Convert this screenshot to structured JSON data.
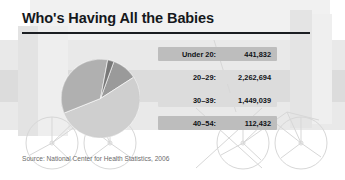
{
  "figure": {
    "title": "Who's Having All the Babies",
    "source": "Source: National Center for Health Statistics, 2006"
  },
  "colors": {
    "title_text": "#15181c",
    "title_rule": "#1b1e22",
    "row_dark": "#bdbdbd",
    "row_light": "#dcdcdc",
    "row_text": "#101317",
    "source_text": "#6b6b6b",
    "slice_under20": "#9a9a9a",
    "slice_20_29": "#cfcfcf",
    "slice_30_39": "#b0b0b0",
    "slice_40_54": "#787878",
    "background": "#ffffff",
    "watermark": "#e6e6e6"
  },
  "rows": [
    {
      "label": "Under 20:",
      "value": "441,832",
      "shade": "dark"
    },
    {
      "label": "20–29:",
      "value": "2,262,694",
      "shade": "light"
    },
    {
      "label": "30–39:",
      "value": "1,449,039",
      "shade": "light"
    },
    {
      "label": "40–54:",
      "value": "112,432",
      "shade": "dark"
    }
  ],
  "chart_data": {
    "type": "pie",
    "title": "Who's Having All the Babies",
    "subtitle": "",
    "xlabel": "",
    "ylabel": "",
    "legend_position": "right",
    "grid": false,
    "categories": [
      "Under 20",
      "20–29",
      "30–39",
      "40–54"
    ],
    "values": [
      441832,
      2262694,
      1449039,
      112432
    ],
    "value_labels": [
      "441,832",
      "2,262,694",
      "1,449,039",
      "112,432"
    ],
    "percentages": [
      10.6,
      54.2,
      34.7,
      2.7
    ],
    "total": 4265997,
    "slice_colors": [
      "#9a9a9a",
      "#cfcfcf",
      "#b0b0b0",
      "#787878"
    ],
    "annotations": [
      "Source: National Center for Health Statistics, 2006"
    ]
  }
}
